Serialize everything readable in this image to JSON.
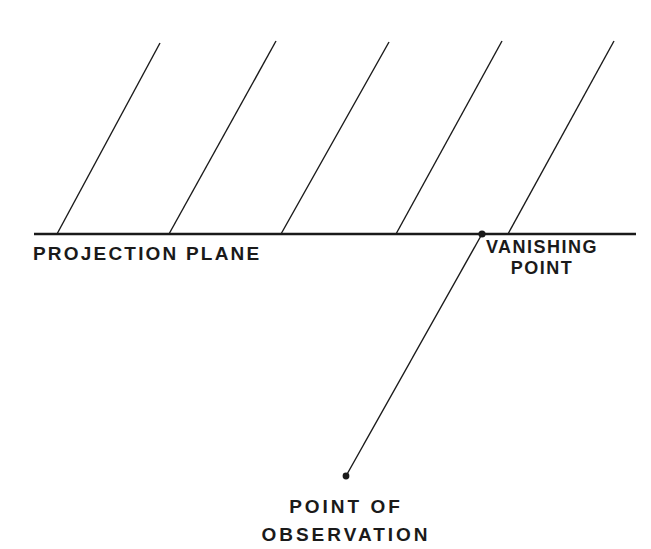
{
  "diagram": {
    "colors": {
      "background": "#ffffff",
      "ink": "#1a1a1a"
    },
    "projection_plane": {
      "label": "PROJECTION PLANE",
      "x1": 34,
      "y1": 234,
      "x2": 636,
      "y2": 234
    },
    "parallel_lines": [
      {
        "x1": 57,
        "y1": 234,
        "x2": 160,
        "y2": 43
      },
      {
        "x1": 169,
        "y1": 234,
        "x2": 276,
        "y2": 41
      },
      {
        "x1": 281,
        "y1": 234,
        "x2": 389,
        "y2": 42
      },
      {
        "x1": 396,
        "y1": 234,
        "x2": 502,
        "y2": 41
      },
      {
        "x1": 508,
        "y1": 234,
        "x2": 614,
        "y2": 41
      }
    ],
    "vanishing_point": {
      "label_line1": "VANISHING",
      "label_line2": "POINT",
      "x": 482,
      "y": 234
    },
    "point_of_observation": {
      "label_line1": "POINT OF",
      "label_line2": "OBSERVATION",
      "x": 346,
      "y": 476
    },
    "sight_line": {
      "x1": 346,
      "y1": 476,
      "x2": 482,
      "y2": 234
    }
  }
}
